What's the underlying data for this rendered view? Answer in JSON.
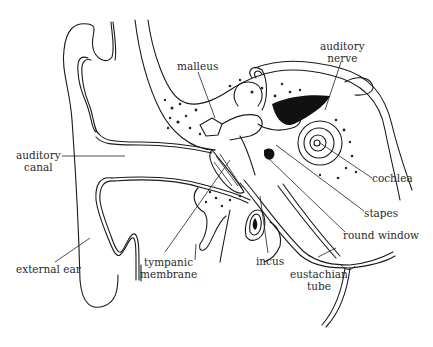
{
  "diagram": {
    "labels": {
      "malleus": "malleus",
      "auditory_nerve_1": "auditory",
      "auditory_nerve_2": "nerve",
      "auditory_canal_1": "auditory",
      "auditory_canal_2": "canal",
      "cochlea": "cochlea",
      "stapes": "stapes",
      "round_window": "round window",
      "external_ear": "external ear",
      "tympanic_membrane_1": "tympanic",
      "tympanic_membrane_2": "membrane",
      "incus": "incus",
      "eustachian_tube_1": "eustachian",
      "eustachian_tube_2": "tube"
    },
    "colors": {
      "ink": "#1a1a1a",
      "background": "#ffffff",
      "label_text": "#2a2a2a"
    }
  }
}
